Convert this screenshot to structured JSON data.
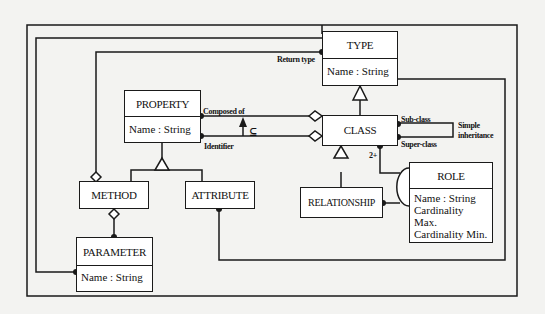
{
  "diagram": {
    "type": "UML class diagram (meta-model)",
    "classes": {
      "type": {
        "name": "TYPE",
        "attributes": [
          "Name : String"
        ]
      },
      "property": {
        "name": "PROPERTY",
        "attributes": [
          "Name : String"
        ]
      },
      "class": {
        "name": "CLASS",
        "attributes": []
      },
      "method": {
        "name": "METHOD",
        "attributes": []
      },
      "attribute": {
        "name": "ATTRIBUTE",
        "attributes": []
      },
      "parameter": {
        "name": "PARAMETER",
        "attributes": [
          "Name : String"
        ]
      },
      "relationship": {
        "name": "RELATIONSHIP",
        "attributes": []
      },
      "role": {
        "name": "ROLE",
        "attributes": [
          "Name : String",
          "Cardinality Max.",
          "Cardinality Min."
        ]
      }
    },
    "labels": {
      "return_type": "Return type",
      "composed_of": "Composed of",
      "subset": "⊆",
      "identifier": "Identifier",
      "sub_class": "Sub-class",
      "super_class": "Super-class",
      "simple_inheritance_1": "Simple",
      "simple_inheritance_2": "inheritance",
      "two_plus": "2+"
    },
    "relations": [
      {
        "from": "CLASS",
        "to": "TYPE",
        "kind": "generalization"
      },
      {
        "from": "METHOD",
        "to": "PROPERTY",
        "kind": "generalization"
      },
      {
        "from": "ATTRIBUTE",
        "to": "PROPERTY",
        "kind": "generalization"
      },
      {
        "from": "RELATIONSHIP",
        "to": "CLASS",
        "kind": "generalization"
      },
      {
        "from": "PROPERTY",
        "to": "CLASS",
        "kind": "aggregation",
        "label": "Composed of"
      },
      {
        "from": "PROPERTY",
        "to": "CLASS",
        "kind": "aggregation",
        "label": "Identifier"
      },
      {
        "from": "Identifier",
        "to": "Composed of",
        "kind": "subset",
        "label": "⊆"
      },
      {
        "from": "PARAMETER",
        "to": "METHOD",
        "kind": "aggregation"
      },
      {
        "from": "TYPE",
        "to": "METHOD",
        "kind": "aggregation",
        "label": "Return type"
      },
      {
        "from": "CLASS",
        "to": "CLASS",
        "kind": "association",
        "label": "Simple inheritance",
        "roles": [
          "Sub-class",
          "Super-class"
        ]
      },
      {
        "from": "CLASS",
        "to": "RELATIONSHIP",
        "kind": "association",
        "via": "ROLE",
        "multiplicity": "2+"
      },
      {
        "from": "TYPE",
        "to": "PARAMETER",
        "kind": "association"
      },
      {
        "from": "TYPE",
        "to": "ATTRIBUTE",
        "kind": "association"
      }
    ]
  }
}
